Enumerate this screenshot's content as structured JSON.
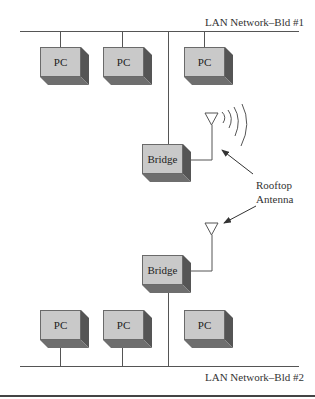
{
  "diagram": {
    "networks": [
      {
        "id": "lan1",
        "label": "LAN Network–Bld #1"
      },
      {
        "id": "lan2",
        "label": "LAN Network–Bld #2"
      }
    ],
    "building1": {
      "pcs": [
        {
          "label": "PC"
        },
        {
          "label": "PC"
        },
        {
          "label": "PC"
        }
      ],
      "bridge": {
        "label": "Bridge"
      }
    },
    "building2": {
      "pcs": [
        {
          "label": "PC"
        },
        {
          "label": "PC"
        },
        {
          "label": "PC"
        }
      ],
      "bridge": {
        "label": "Bridge"
      }
    },
    "callout": {
      "line1": "Rooftop",
      "line2": "Antenna"
    },
    "colors": {
      "box_face": "#c9c9c9",
      "box_side": "#555555",
      "box_bottom": "#6e6e6e",
      "line": "#555555"
    }
  }
}
